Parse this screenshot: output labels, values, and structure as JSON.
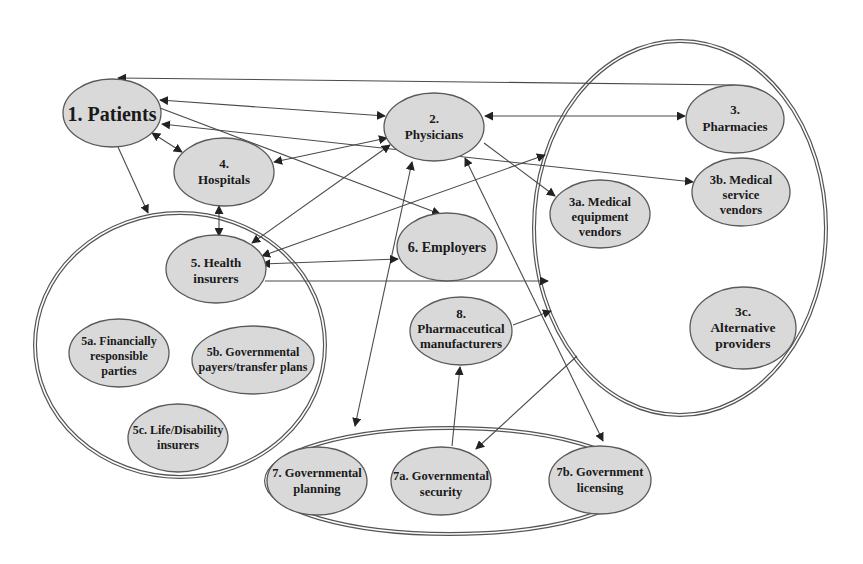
{
  "diagram": {
    "type": "stakeholder-relationship-network",
    "groups": [
      {
        "id": "G3",
        "name": "pharmacy-provider-group",
        "members": [
          "3",
          "3a",
          "3b",
          "3c"
        ]
      },
      {
        "id": "G5",
        "name": "payer-group",
        "members": [
          "5",
          "5a",
          "5b",
          "5c"
        ]
      },
      {
        "id": "G7",
        "name": "government-group",
        "members": [
          "7",
          "7a",
          "7b"
        ]
      }
    ],
    "nodes": {
      "patients": {
        "id": "1",
        "lines": [
          "1. Patients"
        ]
      },
      "physicians": {
        "id": "2",
        "lines": [
          "2.",
          "Physicians"
        ]
      },
      "pharmacies": {
        "id": "3",
        "lines": [
          "3.",
          "Pharmacies"
        ]
      },
      "medical_equipment_vendors": {
        "id": "3a",
        "lines": [
          "3a. Medical",
          "equipment",
          "vendors"
        ]
      },
      "medical_service_vendors": {
        "id": "3b",
        "lines": [
          "3b. Medical",
          "service",
          "vendors"
        ]
      },
      "alternative_providers": {
        "id": "3c",
        "lines": [
          "3c.",
          "Alternative",
          "providers"
        ]
      },
      "hospitals": {
        "id": "4",
        "lines": [
          "4.",
          "Hospitals"
        ]
      },
      "health_insurers": {
        "id": "5",
        "lines": [
          "5. Health",
          "insurers"
        ]
      },
      "financially_responsible": {
        "id": "5a",
        "lines": [
          "5a. Financially",
          "responsible",
          "parties"
        ]
      },
      "governmental_payers": {
        "id": "5b",
        "lines": [
          "5b. Governmental",
          "payers/transfer plans"
        ]
      },
      "life_disability": {
        "id": "5c",
        "lines": [
          "5c. Life/Disability",
          "insurers"
        ]
      },
      "employers": {
        "id": "6",
        "lines": [
          "6. Employers"
        ]
      },
      "governmental_planning": {
        "id": "7",
        "lines": [
          "7. Governmental",
          "planning"
        ]
      },
      "governmental_security": {
        "id": "7a",
        "lines": [
          "7a. Governmental",
          "security"
        ]
      },
      "government_licensing": {
        "id": "7b",
        "lines": [
          "7b. Government",
          "licensing"
        ]
      },
      "pharma_manufacturers": {
        "id": "8",
        "lines": [
          "8.",
          "Pharmaceutical",
          "manufacturers"
        ]
      }
    },
    "edges": [
      {
        "from": "3",
        "to": "1",
        "direction": "one-way"
      },
      {
        "from": "1",
        "to": "2",
        "direction": "both"
      },
      {
        "from": "2",
        "to": "3",
        "direction": "both"
      },
      {
        "from": "1",
        "to": "4",
        "direction": "both"
      },
      {
        "from": "1",
        "to": "G5",
        "direction": "one-way"
      },
      {
        "from": "1",
        "to": "6",
        "direction": "one-way"
      },
      {
        "from": "1",
        "to": "3b",
        "direction": "both"
      },
      {
        "from": "2",
        "to": "4",
        "direction": "both"
      },
      {
        "from": "2",
        "to": "5",
        "direction": "both"
      },
      {
        "from": "2",
        "to": "3a",
        "direction": "one-way"
      },
      {
        "from": "2",
        "to": "3b",
        "direction": "one-way"
      },
      {
        "from": "2",
        "to": "G7",
        "direction": "both"
      },
      {
        "from": "2",
        "to": "7b",
        "direction": "both"
      },
      {
        "from": "4",
        "to": "5",
        "direction": "both"
      },
      {
        "from": "5",
        "to": "6",
        "direction": "both"
      },
      {
        "from": "5",
        "to": "G3",
        "direction": "both"
      },
      {
        "from": "5",
        "to": "G3-lower",
        "direction": "one-way"
      },
      {
        "from": "8",
        "to": "G3",
        "direction": "one-way"
      },
      {
        "from": "7a",
        "to": "8",
        "direction": "one-way"
      },
      {
        "from": "G3",
        "to": "7a",
        "direction": "one-way"
      }
    ]
  }
}
